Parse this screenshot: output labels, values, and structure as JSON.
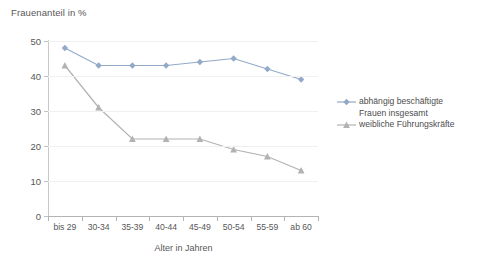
{
  "chart_data": {
    "type": "line",
    "title": "Frauenanteil in %",
    "xlabel": "Alter in Jahren",
    "ylabel": "",
    "categories": [
      "bis 29",
      "30-34",
      "35-39",
      "40-44",
      "45-49",
      "50-54",
      "55-59",
      "ab 60"
    ],
    "ylim": [
      0,
      50
    ],
    "yticks": [
      0,
      10,
      20,
      30,
      40,
      50
    ],
    "grid": true,
    "legend_position": "right",
    "series": [
      {
        "name": "abhängig beschäftigte Frauen insgesamt",
        "name_line1": "abhängig beschäftigte",
        "name_line2": "Frauen insgesamt",
        "marker": "diamond",
        "color": "#93a9c8",
        "values": [
          48,
          43,
          43,
          43,
          44,
          45,
          42,
          39
        ]
      },
      {
        "name": "weibliche Führungskräfte",
        "name_line1": "weibliche Führungskräfte",
        "name_line2": "",
        "marker": "triangle",
        "color": "#b2b2b2",
        "values": [
          43,
          31,
          22,
          22,
          22,
          19,
          17,
          13
        ]
      }
    ]
  },
  "axis": {
    "y_tick_labels": [
      "50",
      "40",
      "30",
      "20",
      "10",
      "0"
    ],
    "x_tick_labels": [
      "bis 29",
      "30-34",
      "35-39",
      "40-44",
      "45-49",
      "50-54",
      "55-59",
      "ab 60"
    ],
    "x_title": "Alter in Jahren"
  },
  "title": {
    "text": "Frauenanteil in %"
  },
  "legend": {
    "items": [
      {
        "line1": "abhängig beschäftigte",
        "line2": "Frauen insgesamt",
        "marker": "diamond",
        "color": "#93a9c8"
      },
      {
        "line1": "weibliche Führungskräfte",
        "line2": "",
        "marker": "triangle",
        "color": "#b2b2b2"
      }
    ]
  },
  "colors": {
    "series_blue": "#93a9c8",
    "series_gray": "#b2b2b2",
    "grid": "#f0f0f0",
    "axis": "#b4b4b4",
    "text": "#575757",
    "background": "#ffffff"
  }
}
